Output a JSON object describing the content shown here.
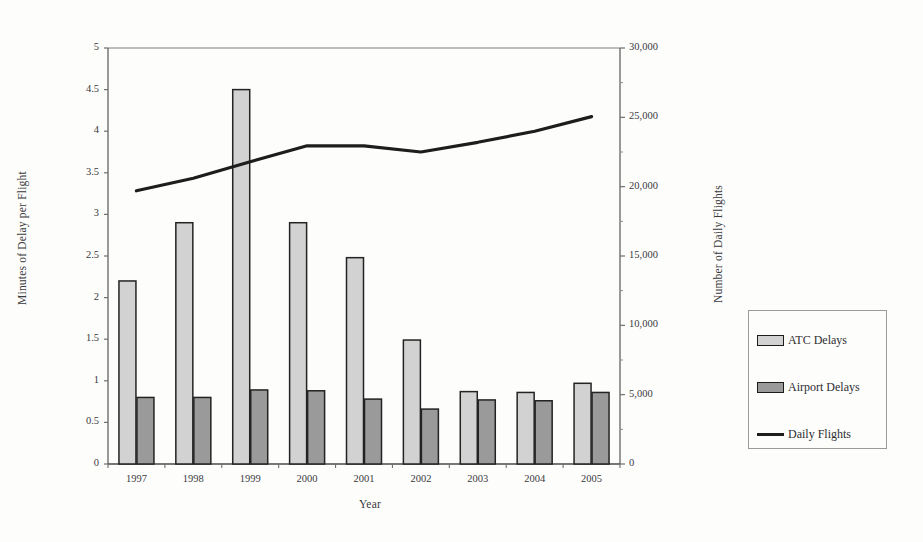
{
  "chart_data": {
    "type": "bar",
    "title": "",
    "xlabel": "Year",
    "ylabel": "Minutes of Delay per Flight",
    "y2label": "Number of Daily Flights",
    "categories": [
      "1997",
      "1998",
      "1999",
      "2000",
      "2001",
      "2002",
      "2003",
      "2004",
      "2005"
    ],
    "ylim": [
      0,
      5
    ],
    "y2lim": [
      0,
      30000
    ],
    "yticks": [
      "0",
      "0.5",
      "1",
      "1.5",
      "2",
      "2.5",
      "3",
      "3.5",
      "4",
      "4.5",
      "5"
    ],
    "y2ticks": [
      "0",
      "5,000",
      "10,000",
      "15,000",
      "20,000",
      "25,000",
      "30,000"
    ],
    "grid": false,
    "legend_position": "right",
    "series": [
      {
        "name": "ATC Delays",
        "type": "bar",
        "axis": "left",
        "color": "#d2d2d2",
        "values": [
          2.2,
          2.9,
          4.5,
          2.9,
          2.48,
          1.49,
          0.87,
          0.86,
          0.97
        ]
      },
      {
        "name": "Airport Delays",
        "type": "bar",
        "axis": "left",
        "color": "#9a9a9a",
        "values": [
          0.8,
          0.8,
          0.89,
          0.88,
          0.78,
          0.66,
          0.77,
          0.76,
          0.86
        ]
      },
      {
        "name": "Daily Flights",
        "type": "line",
        "axis": "right",
        "color": "#1d1d1d",
        "values": [
          19700,
          20600,
          21800,
          22950,
          22950,
          22500,
          23200,
          24000,
          25050
        ]
      }
    ]
  },
  "legend": {
    "items": [
      {
        "label": "ATC Delays",
        "marker": "light-gray-swatch"
      },
      {
        "label": "Airport Delays",
        "marker": "dark-gray-swatch"
      },
      {
        "label": "Daily Flights",
        "marker": "black-line"
      }
    ]
  }
}
